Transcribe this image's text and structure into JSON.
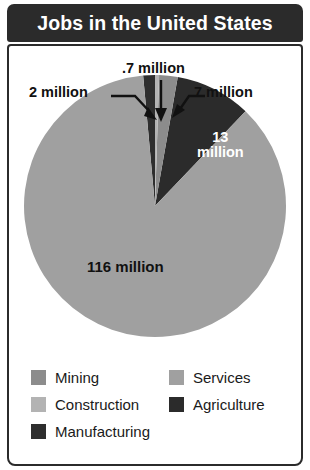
{
  "header": {
    "title": "Jobs in the United States"
  },
  "chart_data": {
    "type": "pie",
    "title": "Jobs in the United States",
    "unit": "million jobs",
    "total": 138.7,
    "legend_position": "bottom",
    "categories": [
      "Mining",
      "Construction",
      "Manufacturing",
      "Services",
      "Agriculture"
    ],
    "values": [
      7,
      0.7,
      2,
      116,
      13
    ],
    "labels": [
      "7 million",
      ".7 million",
      "2 million",
      "116 million",
      "13 million"
    ],
    "colors": [
      "#8c8c8c",
      "#b3b3b3",
      "#2e2e2e",
      "#a0a0a0",
      "#2b2b2b"
    ],
    "slices": [
      {
        "name": "Agriculture",
        "value": 13,
        "label": "13 million",
        "color": "#2b2b2b",
        "start_deg": 10,
        "end_deg": 43.7,
        "label_placement": "inside",
        "label_color": "#ffffff"
      },
      {
        "name": "Mining",
        "value": 7,
        "label": "7 million",
        "color": "#8c8c8c",
        "start_deg": 1.8,
        "end_deg": 10,
        "label_placement": "callout",
        "label_color": "#111111"
      },
      {
        "name": "Construction",
        "value": 0.7,
        "label": ".7 million",
        "color": "#b3b3b3",
        "start_deg": 0,
        "end_deg": 1.8,
        "label_placement": "callout",
        "label_color": "#111111"
      },
      {
        "name": "Manufacturing",
        "value": 2,
        "label": "2 million",
        "color": "#2e2e2e",
        "start_deg": 354.8,
        "end_deg": 360,
        "label_placement": "callout",
        "label_color": "#111111"
      },
      {
        "name": "Services",
        "value": 116,
        "label": "116 million",
        "color": "#a0a0a0",
        "start_deg": 43.7,
        "end_deg": 354.8,
        "label_placement": "inside",
        "label_color": "#111111"
      }
    ]
  },
  "callouts": [
    {
      "id": "2m",
      "text": "2 million",
      "arrow": "angled-right-down"
    },
    {
      "id": "07m",
      "text": ".7 million",
      "arrow": "vertical-down"
    },
    {
      "id": "7m",
      "text": "7 million",
      "arrow": "angled-left-down"
    }
  ],
  "pie_labels": {
    "services": "116 million",
    "agriculture_line1": "13",
    "agriculture_line2": "million"
  },
  "legend": {
    "left_column": [
      {
        "label": "Mining",
        "color": "#8c8c8c"
      },
      {
        "label": "Construction",
        "color": "#b3b3b3"
      },
      {
        "label": "Manufacturing",
        "color": "#2e2e2e"
      }
    ],
    "right_column": [
      {
        "label": "Services",
        "color": "#a0a0a0"
      },
      {
        "label": "Agriculture",
        "color": "#2b2b2b"
      }
    ]
  },
  "theme": {
    "header_bg": "#2b2b2b",
    "header_text": "#ffffff",
    "body_bg": "#ffffff",
    "border": "#2b2b2b",
    "text": "#111111"
  }
}
